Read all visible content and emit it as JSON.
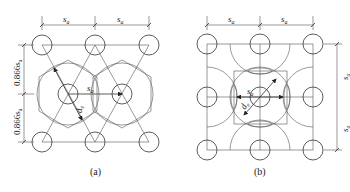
{
  "figure_a": {
    "caption": "(a)",
    "dim_top_left": "s",
    "dim_top_right": "s",
    "dim_sub": "a",
    "dim_left_upper": "0.866s",
    "dim_left_lower": "0.866s",
    "inner_spacing": "s",
    "influence_diameter": "d",
    "influence_sub": "e"
  },
  "figure_b": {
    "caption": "(b)",
    "dim_top_left": "s",
    "dim_top_right": "s",
    "dim_sub": "a",
    "dim_right_upper": "s",
    "dim_right_lower": "s",
    "inner_spacing": "s",
    "influence_diameter": "d",
    "influence_sub": "e"
  }
}
